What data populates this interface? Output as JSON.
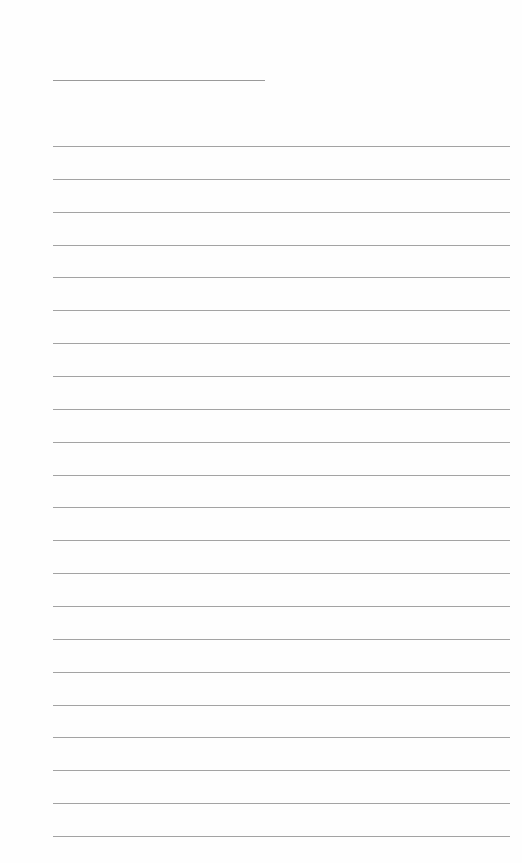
{
  "page": {
    "type": "lined-notepaper",
    "background_color": "#fefefe",
    "line_color": "#a3a3a3",
    "title_line": {
      "x": 53,
      "y": 80,
      "width": 212,
      "text": ""
    },
    "ruled_lines": {
      "x": 53,
      "width": 457,
      "first_y": 146,
      "spacing": 32.86,
      "count": 22,
      "lines": [
        "",
        "",
        "",
        "",
        "",
        "",
        "",
        "",
        "",
        "",
        "",
        "",
        "",
        "",
        "",
        "",
        "",
        "",
        "",
        "",
        "",
        ""
      ]
    }
  }
}
